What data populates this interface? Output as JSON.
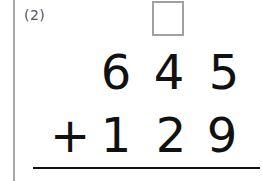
{
  "problem": {
    "label": "(2)",
    "answer_box": "",
    "top_number": [
      "6",
      "4",
      "5"
    ],
    "operator": "+",
    "bottom_number": [
      "1",
      "2",
      "9"
    ]
  }
}
